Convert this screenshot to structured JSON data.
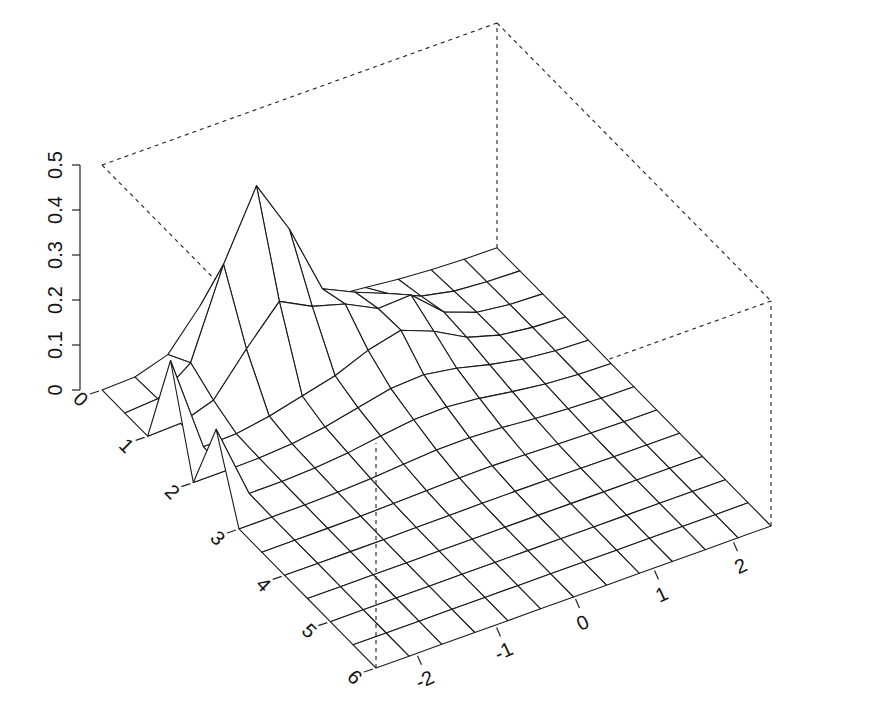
{
  "chart_data": {
    "type": "surface",
    "title": "",
    "x_axis": {
      "label": "",
      "ticks": [
        "0",
        "1",
        "2",
        "3",
        "4",
        "5",
        "6"
      ],
      "range": [
        0,
        6
      ]
    },
    "y_axis": {
      "label": "",
      "ticks": [
        "-2",
        "-1",
        "0",
        "1",
        "2"
      ],
      "range": [
        -2.5,
        2.5
      ]
    },
    "z_axis": {
      "label": "",
      "ticks": [
        "0",
        "0.1",
        "0.2",
        "0.3",
        "0.4",
        "0.5"
      ],
      "range": [
        0,
        0.5
      ]
    },
    "grid_x": [
      0,
      0.5,
      1,
      1.5,
      2,
      2.5,
      3,
      3.5,
      4,
      4.5,
      5,
      5.5,
      6
    ],
    "grid_y": [
      -2.5,
      -2.083,
      -1.667,
      -1.25,
      -0.833,
      -0.417,
      0,
      0.417,
      0.833,
      1.25,
      1.667,
      2.083,
      2.5
    ],
    "peaks": [
      {
        "x": 1.5,
        "y": -2.5,
        "z": 0.22
      },
      {
        "x": 2.5,
        "y": -2.5,
        "z": 0.17
      },
      {
        "x": 0.5,
        "y": -0.833,
        "z": 0.4
      },
      {
        "x": 1.0,
        "y": 0.417,
        "z": 0.1
      }
    ],
    "bounding_box": "dashed",
    "grid": true,
    "legend": null
  },
  "axes": {
    "z_labels": [
      "0",
      "0.1",
      "0.2",
      "0.3",
      "0.4",
      "0.5"
    ],
    "x_labels": [
      "0",
      "1",
      "2",
      "3",
      "4",
      "5",
      "6"
    ],
    "y_labels": [
      "-2",
      "-1",
      "0",
      "1",
      "2"
    ]
  }
}
